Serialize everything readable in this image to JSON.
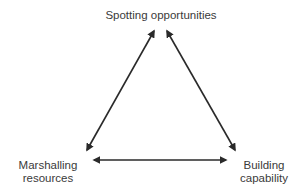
{
  "nodes": {
    "top": "Spotting opportunities",
    "left": [
      "Marshalling",
      "resources"
    ],
    "right": [
      "Building",
      "capability"
    ]
  },
  "edges": [
    {
      "from": "Spotting opportunities",
      "to": "Marshalling resources",
      "direction": "bidirectional"
    },
    {
      "from": "Spotting opportunities",
      "to": "Building capability",
      "direction": "bidirectional"
    },
    {
      "from": "Marshalling resources",
      "to": "Building capability",
      "direction": "bidirectional"
    }
  ],
  "colors": {
    "arrow": "#2a2a2a",
    "text": "#3a3a3a",
    "background": "#ffffff"
  }
}
